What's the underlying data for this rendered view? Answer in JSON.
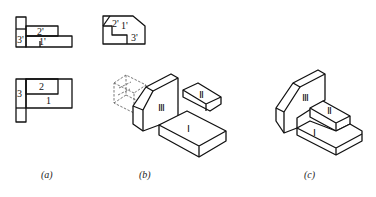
{
  "figure": {
    "panels": [
      {
        "id": "a",
        "caption": "(a)",
        "views": {
          "front": {
            "labels": [
              "3'",
              "2'",
              "1'"
            ]
          },
          "side": {
            "labels": [
              "2'",
              "1'",
              "3'"
            ]
          },
          "top": {
            "labels": [
              "3",
              "2",
              "1"
            ]
          }
        }
      },
      {
        "id": "b",
        "caption": "(b)",
        "parts": {
          "large_block": "Ⅲ",
          "small_block": "Ⅱ",
          "base_block": "Ⅰ"
        }
      },
      {
        "id": "c",
        "caption": "(c)",
        "parts": {
          "back": "Ⅲ",
          "middle": "Ⅱ",
          "bottom": "Ⅰ"
        }
      }
    ]
  }
}
